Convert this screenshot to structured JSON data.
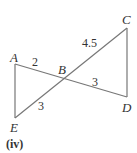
{
  "diagram": {
    "caption": "(iv)",
    "points": {
      "A": {
        "label": "A",
        "x": 15,
        "y": 64
      },
      "B": {
        "label": "B",
        "x": 63,
        "y": 79
      },
      "C": {
        "label": "C",
        "x": 127,
        "y": 28
      },
      "D": {
        "label": "D",
        "x": 127,
        "y": 97
      },
      "E": {
        "label": "E",
        "x": 15,
        "y": 118
      }
    },
    "segments": [
      {
        "from": "A",
        "to": "E"
      },
      {
        "from": "A",
        "to": "D"
      },
      {
        "from": "E",
        "to": "C"
      },
      {
        "from": "C",
        "to": "D"
      }
    ],
    "lengths": {
      "AB": "2",
      "BD": "3",
      "BE": "3",
      "BC": "4.5"
    },
    "line_color": "#777777"
  }
}
